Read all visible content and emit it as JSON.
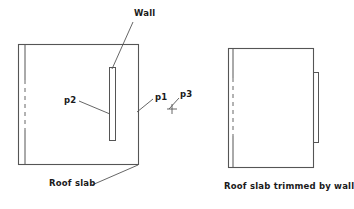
{
  "figure": {
    "title_absent": true,
    "background_color": "#ffffff",
    "line_color": "#4d4d4d",
    "text_color": "#1a1a1a"
  },
  "left_diagram": {
    "name": "roof-slab-with-wall",
    "caption": "Roof slab",
    "labels": {
      "wall": "Wall",
      "p1": "p1",
      "p2": "p2",
      "p3": "p3"
    },
    "elements": {
      "slab_outline": "rectangle",
      "slab_inner_edge": "vertical line with dashed middle segment",
      "wall_element": "narrow vertical rectangle",
      "point_marker_p3": "cross-mark"
    }
  },
  "right_diagram": {
    "name": "roof-slab-trimmed-by-wall",
    "caption": "Roof slab trimmed by wall",
    "elements": {
      "slab_outline": "rectangle",
      "slab_inner_edge": "vertical line with dashed middle segment",
      "wall_element": "narrow vertical rectangle outside right edge"
    }
  }
}
